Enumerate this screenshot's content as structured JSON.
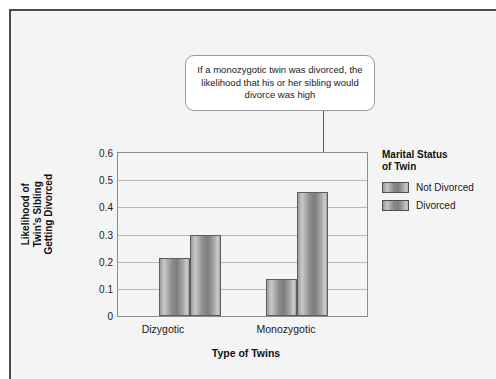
{
  "annotation": {
    "text": "If a monozygotic twin was divorced, the likelihood that his or her sibling would divorce was high",
    "points_to": "Monozygotic / Divorced"
  },
  "legend": {
    "title_line1": "Marital Status",
    "title_line2": "of Twin"
  },
  "axis": {
    "x_title": "Type of Twins",
    "y_title_line1": "Likelihood of",
    "y_title_line2": "Twin's Sibling",
    "y_title_line3": "Getting Divorced"
  },
  "chart_data": {
    "type": "bar",
    "title": "",
    "xlabel": "Type of Twins",
    "ylabel": "Likelihood of Twin's Sibling Getting Divorced",
    "categories": [
      "Dizygotic",
      "Monozygotic"
    ],
    "series": [
      {
        "name": "Not Divorced",
        "values": [
          0.215,
          0.135
        ]
      },
      {
        "name": "Divorced",
        "values": [
          0.3,
          0.455
        ]
      }
    ],
    "ylim": [
      0,
      0.6
    ],
    "yticks": [
      "0.6",
      "0.5",
      "0.4",
      "0.3",
      "0.2",
      "0.1",
      "0"
    ],
    "ytick_values": [
      0.6,
      0.5,
      0.4,
      0.3,
      0.2,
      0.1,
      0
    ],
    "grid": true,
    "legend_position": "right",
    "annotations": [
      {
        "text": "If a monozygotic twin was divorced, the likelihood that his or her sibling would divorce was high",
        "target_category": "Monozygotic",
        "target_series": "Divorced"
      }
    ]
  }
}
